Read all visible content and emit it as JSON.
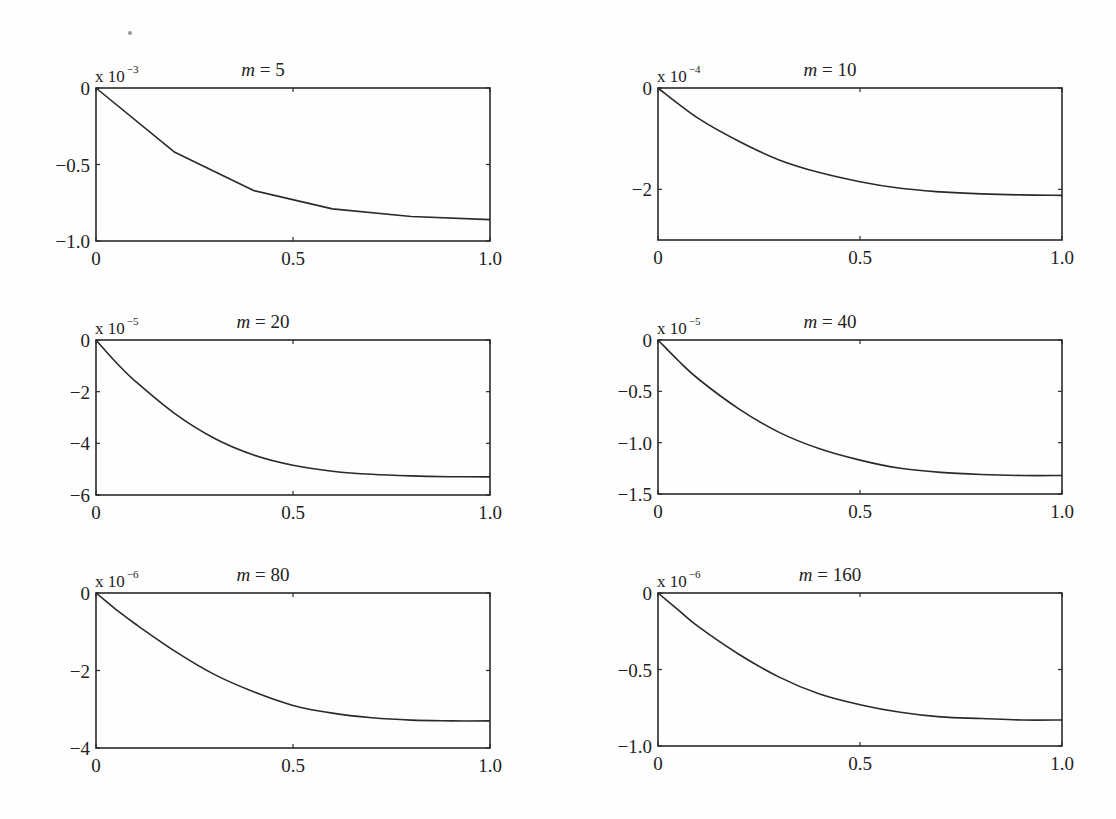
{
  "chart_data": [
    {
      "type": "line",
      "title": "m = 5",
      "title_var": "m",
      "title_value": "5",
      "scale_label": "x 10",
      "scale_exponent": "-3",
      "xlabel": "",
      "ylabel": "",
      "xlim": [
        0,
        1.0
      ],
      "ylim": [
        -1.0,
        0
      ],
      "xticks": [
        0,
        0.5,
        1.0
      ],
      "xtick_labels": [
        "0",
        "0.5",
        "1.0"
      ],
      "yticks": [
        0,
        -0.5,
        -1.0
      ],
      "ytick_labels": [
        "0",
        "−0.5",
        "−1.0"
      ],
      "x": [
        0,
        0.2,
        0.4,
        0.6,
        0.8,
        1.0
      ],
      "y": [
        0,
        -0.42,
        -0.67,
        -0.79,
        -0.84,
        -0.86
      ],
      "grid": false
    },
    {
      "type": "line",
      "title": "m = 10",
      "title_var": "m",
      "title_value": "10",
      "scale_label": "x 10",
      "scale_exponent": "-4",
      "xlabel": "",
      "ylabel": "",
      "xlim": [
        0,
        1.0
      ],
      "ylim": [
        -3,
        0
      ],
      "xticks": [
        0,
        0.5,
        1.0
      ],
      "xtick_labels": [
        "0",
        "0.5",
        "1.0"
      ],
      "yticks": [
        0,
        -2
      ],
      "ytick_labels": [
        "0",
        "−2"
      ],
      "x": [
        0,
        0.1,
        0.2,
        0.3,
        0.4,
        0.5,
        0.6,
        0.7,
        0.8,
        0.9,
        1.0
      ],
      "y": [
        0,
        -0.6,
        -1.05,
        -1.42,
        -1.67,
        -1.85,
        -1.98,
        -2.05,
        -2.09,
        -2.11,
        -2.12
      ],
      "grid": false
    },
    {
      "type": "line",
      "title": "m = 20",
      "title_var": "m",
      "title_value": "20",
      "scale_label": "x 10",
      "scale_exponent": "-5",
      "xlabel": "",
      "ylabel": "",
      "xlim": [
        0,
        1.0
      ],
      "ylim": [
        -6,
        0
      ],
      "xticks": [
        0,
        0.5,
        1.0
      ],
      "xtick_labels": [
        "0",
        "0.5",
        "1.0"
      ],
      "yticks": [
        0,
        -2,
        -4,
        -6
      ],
      "ytick_labels": [
        "0",
        "−2",
        "−4",
        "−6"
      ],
      "x": [
        0,
        0.05,
        0.1,
        0.2,
        0.3,
        0.4,
        0.5,
        0.6,
        0.7,
        0.8,
        0.9,
        1.0
      ],
      "y": [
        0,
        -0.85,
        -1.6,
        -2.85,
        -3.8,
        -4.45,
        -4.85,
        -5.08,
        -5.2,
        -5.26,
        -5.29,
        -5.3
      ],
      "grid": false
    },
    {
      "type": "line",
      "title": "m = 40",
      "title_var": "m",
      "title_value": "40",
      "scale_label": "x 10",
      "scale_exponent": "-5",
      "xlabel": "",
      "ylabel": "",
      "xlim": [
        0,
        1.0
      ],
      "ylim": [
        -1.5,
        0
      ],
      "xticks": [
        0,
        0.5,
        1.0
      ],
      "xtick_labels": [
        "0",
        "0.5",
        "1.0"
      ],
      "yticks": [
        0,
        -0.5,
        -1.0,
        -1.5
      ],
      "ytick_labels": [
        "0",
        "−0.5",
        "−1.0",
        "−1.5"
      ],
      "x": [
        0,
        0.05,
        0.1,
        0.2,
        0.3,
        0.4,
        0.5,
        0.6,
        0.7,
        0.8,
        0.9,
        1.0
      ],
      "y": [
        0,
        -0.2,
        -0.38,
        -0.67,
        -0.9,
        -1.06,
        -1.17,
        -1.25,
        -1.29,
        -1.31,
        -1.32,
        -1.32
      ],
      "grid": false
    },
    {
      "type": "line",
      "title": "m = 80",
      "title_var": "m",
      "title_value": "80",
      "scale_label": "x 10",
      "scale_exponent": "-6",
      "xlabel": "",
      "ylabel": "",
      "xlim": [
        0,
        1.0
      ],
      "ylim": [
        -4,
        0
      ],
      "xticks": [
        0,
        0.5,
        1.0
      ],
      "xtick_labels": [
        "0",
        "0.5",
        "1.0"
      ],
      "yticks": [
        0,
        -2,
        -4
      ],
      "ytick_labels": [
        "0",
        "−2",
        "−4"
      ],
      "x": [
        0,
        0.05,
        0.1,
        0.2,
        0.3,
        0.4,
        0.5,
        0.6,
        0.7,
        0.8,
        0.9,
        1.0
      ],
      "y": [
        0,
        -0.42,
        -0.8,
        -1.5,
        -2.1,
        -2.55,
        -2.9,
        -3.1,
        -3.22,
        -3.28,
        -3.3,
        -3.3
      ],
      "grid": false
    },
    {
      "type": "line",
      "title": "m = 160",
      "title_var": "m",
      "title_value": "160",
      "scale_label": "x 10",
      "scale_exponent": "-6",
      "xlabel": "",
      "ylabel": "",
      "xlim": [
        0,
        1.0
      ],
      "ylim": [
        -1.0,
        0
      ],
      "xticks": [
        0,
        0.5,
        1.0
      ],
      "xtick_labels": [
        "0",
        "0.5",
        "1.0"
      ],
      "yticks": [
        0,
        -0.5,
        -1.0
      ],
      "ytick_labels": [
        "0",
        "−0.5",
        "−1.0"
      ],
      "x": [
        0,
        0.05,
        0.1,
        0.2,
        0.3,
        0.4,
        0.5,
        0.6,
        0.7,
        0.8,
        0.9,
        1.0
      ],
      "y": [
        0,
        -0.11,
        -0.22,
        -0.4,
        -0.55,
        -0.66,
        -0.73,
        -0.78,
        -0.81,
        -0.82,
        -0.83,
        -0.83
      ],
      "grid": false
    }
  ],
  "layout": {
    "panels": [
      {
        "left": 96,
        "top": 88,
        "right": 490,
        "bottom": 241
      },
      {
        "left": 658,
        "top": 88,
        "right": 1062,
        "bottom": 240
      },
      {
        "left": 96,
        "top": 340,
        "right": 490,
        "bottom": 495
      },
      {
        "left": 658,
        "top": 340,
        "right": 1062,
        "bottom": 494
      },
      {
        "left": 96,
        "top": 593,
        "right": 490,
        "bottom": 748
      },
      {
        "left": 658,
        "top": 593,
        "right": 1062,
        "bottom": 746
      }
    ],
    "line_color": "#2a2a2a",
    "axis_color": "#2a2a2a"
  }
}
